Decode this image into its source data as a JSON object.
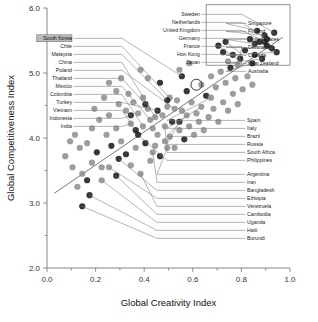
{
  "chart_data": {
    "type": "scatter",
    "title": "",
    "xlabel": "Global Creativity Index",
    "ylabel": "Global Competitiveness Index",
    "xlim": [
      0.0,
      1.0
    ],
    "ylim": [
      2.0,
      6.0
    ],
    "xticks": [
      "0.0",
      "0.2",
      "0.4",
      "0.6",
      "0.8",
      "1.0"
    ],
    "yticks": [
      "2.0",
      "3.0",
      "4.0",
      "5.0",
      "6.0"
    ],
    "xtick_values": [
      0.0,
      0.2,
      0.4,
      0.6,
      0.8,
      1.0
    ],
    "ytick_values": [
      2.0,
      3.0,
      4.0,
      5.0,
      6.0
    ],
    "minor_xticks": [
      0.1,
      0.3,
      0.5,
      0.7,
      0.9
    ],
    "minor_yticks": [
      2.5,
      3.5,
      4.5,
      5.5
    ],
    "grid": false,
    "legend": "none",
    "trendline": {
      "x0": 0.03,
      "y0": 3.15,
      "x1": 0.97,
      "y1": 5.55
    },
    "highlight_ring": {
      "x": 0.615,
      "y": 4.82,
      "r": 5.5
    },
    "inset_box": {
      "x0": 0.655,
      "y0": 5.12,
      "x1": 1.0,
      "y1": 6.05
    },
    "marker_colors": {
      "dark": "#1b1b1b",
      "gray": "#8f8f8f"
    },
    "labeled_points": [
      {
        "name": "South Korea",
        "x": 0.555,
        "y": 4.95,
        "color": "dark",
        "group": "left"
      },
      {
        "name": "Chile",
        "x": 0.505,
        "y": 4.62,
        "color": "gray",
        "group": "left"
      },
      {
        "name": "Malaysia",
        "x": 0.495,
        "y": 4.58,
        "color": "dark",
        "group": "left"
      },
      {
        "name": "China",
        "x": 0.445,
        "y": 4.32,
        "color": "gray",
        "group": "left"
      },
      {
        "name": "Poland",
        "x": 0.525,
        "y": 4.45,
        "color": "gray",
        "group": "left"
      },
      {
        "name": "Thailand",
        "x": 0.405,
        "y": 4.52,
        "color": "dark",
        "group": "left"
      },
      {
        "name": "Mexico",
        "x": 0.425,
        "y": 4.28,
        "color": "gray",
        "group": "left"
      },
      {
        "name": "Colombia",
        "x": 0.395,
        "y": 4.18,
        "color": "gray",
        "group": "left"
      },
      {
        "name": "Turkey",
        "x": 0.455,
        "y": 4.42,
        "color": "dark",
        "group": "left"
      },
      {
        "name": "Vietnam",
        "x": 0.365,
        "y": 4.12,
        "color": "dark",
        "group": "left"
      },
      {
        "name": "Indonesia",
        "x": 0.345,
        "y": 4.35,
        "color": "dark",
        "group": "left"
      },
      {
        "name": "India",
        "x": 0.345,
        "y": 4.22,
        "color": "gray",
        "group": "left"
      },
      {
        "name": "Sweden",
        "x": 0.935,
        "y": 5.62,
        "color": "dark",
        "group": "top"
      },
      {
        "name": "Netherlands",
        "x": 0.905,
        "y": 5.52,
        "color": "dark",
        "group": "top"
      },
      {
        "name": "United Kingdom",
        "x": 0.895,
        "y": 5.48,
        "color": "dark",
        "group": "top"
      },
      {
        "name": "Germany",
        "x": 0.835,
        "y": 5.52,
        "color": "dark",
        "group": "top"
      },
      {
        "name": "France",
        "x": 0.785,
        "y": 5.12,
        "color": "gray",
        "group": "top"
      },
      {
        "name": "Hon Kong",
        "x": 0.735,
        "y": 5.48,
        "color": "dark",
        "group": "top"
      },
      {
        "name": "Japan",
        "x": 0.705,
        "y": 5.42,
        "color": "dark",
        "group": "top"
      },
      {
        "name": "Singapore",
        "x": 0.865,
        "y": 5.65,
        "color": "dark",
        "group": "right-top"
      },
      {
        "name": "Finland",
        "x": 0.895,
        "y": 5.58,
        "color": "dark",
        "group": "right-top"
      },
      {
        "name": "United States",
        "x": 0.855,
        "y": 5.45,
        "color": "dark",
        "group": "right-top"
      },
      {
        "name": "Denmark",
        "x": 0.925,
        "y": 5.38,
        "color": "dark",
        "group": "right-top"
      },
      {
        "name": "Canada",
        "x": 0.945,
        "y": 5.32,
        "color": "dark",
        "group": "right-top"
      },
      {
        "name": "New Zealand",
        "x": 0.885,
        "y": 5.22,
        "color": "dark",
        "group": "right-top"
      },
      {
        "name": "Australia",
        "x": 0.845,
        "y": 5.15,
        "color": "dark",
        "group": "right-top"
      },
      {
        "name": "Spain",
        "x": 0.675,
        "y": 4.62,
        "color": "gray",
        "group": "right-mid"
      },
      {
        "name": "Italy",
        "x": 0.635,
        "y": 4.48,
        "color": "gray",
        "group": "right-mid"
      },
      {
        "name": "Brazil",
        "x": 0.575,
        "y": 4.35,
        "color": "gray",
        "group": "right-mid"
      },
      {
        "name": "Russia",
        "x": 0.545,
        "y": 4.25,
        "color": "dark",
        "group": "right-mid"
      },
      {
        "name": "South Africa",
        "x": 0.485,
        "y": 4.18,
        "color": "gray",
        "group": "right-mid"
      },
      {
        "name": "Philippines",
        "x": 0.375,
        "y": 4.05,
        "color": "dark",
        "group": "right-mid"
      },
      {
        "name": "Argentina",
        "x": 0.495,
        "y": 3.85,
        "color": "gray",
        "group": "right-low"
      },
      {
        "name": "Iran",
        "x": 0.435,
        "y": 3.78,
        "color": "gray",
        "group": "right-low"
      },
      {
        "name": "Bangladesh",
        "x": 0.295,
        "y": 3.68,
        "color": "dark",
        "group": "right-low"
      },
      {
        "name": "Ethiopia",
        "x": 0.255,
        "y": 3.55,
        "color": "gray",
        "group": "right-low"
      },
      {
        "name": "Venezuela",
        "x": 0.385,
        "y": 3.45,
        "color": "gray",
        "group": "right-low"
      },
      {
        "name": "Cambodia",
        "x": 0.285,
        "y": 3.42,
        "color": "dark",
        "group": "right-low"
      },
      {
        "name": "Uganda",
        "x": 0.225,
        "y": 3.35,
        "color": "gray",
        "group": "right-low"
      },
      {
        "name": "Haiti",
        "x": 0.175,
        "y": 3.12,
        "color": "dark",
        "group": "right-low"
      },
      {
        "name": "Burundi",
        "x": 0.145,
        "y": 2.95,
        "color": "dark",
        "group": "right-low"
      }
    ],
    "unlabeled_points": [
      {
        "x": 0.145,
        "y": 3.45,
        "color": "gray"
      },
      {
        "x": 0.185,
        "y": 3.62,
        "color": "gray"
      },
      {
        "x": 0.205,
        "y": 3.78,
        "color": "dark"
      },
      {
        "x": 0.225,
        "y": 3.55,
        "color": "gray"
      },
      {
        "x": 0.165,
        "y": 3.92,
        "color": "gray"
      },
      {
        "x": 0.245,
        "y": 4.05,
        "color": "gray"
      },
      {
        "x": 0.265,
        "y": 3.88,
        "color": "dark"
      },
      {
        "x": 0.285,
        "y": 4.15,
        "color": "gray"
      },
      {
        "x": 0.305,
        "y": 3.95,
        "color": "gray"
      },
      {
        "x": 0.325,
        "y": 4.42,
        "color": "gray"
      },
      {
        "x": 0.355,
        "y": 4.55,
        "color": "gray"
      },
      {
        "x": 0.375,
        "y": 4.38,
        "color": "gray"
      },
      {
        "x": 0.395,
        "y": 4.62,
        "color": "gray"
      },
      {
        "x": 0.415,
        "y": 4.45,
        "color": "gray"
      },
      {
        "x": 0.435,
        "y": 4.15,
        "color": "gray"
      },
      {
        "x": 0.455,
        "y": 4.05,
        "color": "gray"
      },
      {
        "x": 0.475,
        "y": 4.35,
        "color": "gray"
      },
      {
        "x": 0.495,
        "y": 4.48,
        "color": "gray"
      },
      {
        "x": 0.515,
        "y": 4.25,
        "color": "dark"
      },
      {
        "x": 0.535,
        "y": 4.58,
        "color": "gray"
      },
      {
        "x": 0.555,
        "y": 4.42,
        "color": "gray"
      },
      {
        "x": 0.575,
        "y": 4.72,
        "color": "dark"
      },
      {
        "x": 0.595,
        "y": 4.55,
        "color": "gray"
      },
      {
        "x": 0.615,
        "y": 4.38,
        "color": "gray"
      },
      {
        "x": 0.635,
        "y": 4.82,
        "color": "gray"
      },
      {
        "x": 0.655,
        "y": 4.65,
        "color": "dark"
      },
      {
        "x": 0.675,
        "y": 4.95,
        "color": "gray"
      },
      {
        "x": 0.695,
        "y": 4.78,
        "color": "gray"
      },
      {
        "x": 0.715,
        "y": 5.02,
        "color": "gray"
      },
      {
        "x": 0.735,
        "y": 4.85,
        "color": "gray"
      },
      {
        "x": 0.755,
        "y": 5.08,
        "color": "dark"
      },
      {
        "x": 0.775,
        "y": 4.92,
        "color": "gray"
      },
      {
        "x": 0.185,
        "y": 4.15,
        "color": "gray"
      },
      {
        "x": 0.215,
        "y": 4.28,
        "color": "gray"
      },
      {
        "x": 0.255,
        "y": 4.35,
        "color": "gray"
      },
      {
        "x": 0.295,
        "y": 4.52,
        "color": "gray"
      },
      {
        "x": 0.335,
        "y": 4.68,
        "color": "gray"
      },
      {
        "x": 0.125,
        "y": 3.25,
        "color": "gray"
      },
      {
        "x": 0.105,
        "y": 3.55,
        "color": "gray"
      },
      {
        "x": 0.165,
        "y": 3.35,
        "color": "dark"
      },
      {
        "x": 0.325,
        "y": 3.75,
        "color": "dark"
      },
      {
        "x": 0.345,
        "y": 3.58,
        "color": "gray"
      },
      {
        "x": 0.365,
        "y": 3.85,
        "color": "gray"
      },
      {
        "x": 0.405,
        "y": 3.92,
        "color": "dark"
      },
      {
        "x": 0.425,
        "y": 3.65,
        "color": "gray"
      },
      {
        "x": 0.445,
        "y": 3.88,
        "color": "gray"
      },
      {
        "x": 0.465,
        "y": 3.72,
        "color": "dark"
      },
      {
        "x": 0.485,
        "y": 3.95,
        "color": "gray"
      },
      {
        "x": 0.505,
        "y": 4.02,
        "color": "gray"
      },
      {
        "x": 0.525,
        "y": 3.85,
        "color": "gray"
      },
      {
        "x": 0.545,
        "y": 4.12,
        "color": "gray"
      },
      {
        "x": 0.565,
        "y": 3.98,
        "color": "dark"
      },
      {
        "x": 0.585,
        "y": 4.18,
        "color": "gray"
      },
      {
        "x": 0.605,
        "y": 4.05,
        "color": "gray"
      },
      {
        "x": 0.625,
        "y": 4.25,
        "color": "gray"
      },
      {
        "x": 0.645,
        "y": 4.12,
        "color": "gray"
      },
      {
        "x": 0.665,
        "y": 4.32,
        "color": "gray"
      },
      {
        "x": 0.685,
        "y": 4.45,
        "color": "gray"
      },
      {
        "x": 0.705,
        "y": 4.25,
        "color": "gray"
      },
      {
        "x": 0.725,
        "y": 4.55,
        "color": "gray"
      },
      {
        "x": 0.745,
        "y": 4.42,
        "color": "gray"
      },
      {
        "x": 0.765,
        "y": 4.68,
        "color": "gray"
      },
      {
        "x": 0.785,
        "y": 4.52,
        "color": "gray"
      },
      {
        "x": 0.805,
        "y": 4.75,
        "color": "gray"
      },
      {
        "x": 0.825,
        "y": 4.95,
        "color": "gray"
      },
      {
        "x": 0.845,
        "y": 4.82,
        "color": "gray"
      },
      {
        "x": 0.795,
        "y": 5.22,
        "color": "dark"
      },
      {
        "x": 0.815,
        "y": 5.35,
        "color": "dark"
      },
      {
        "x": 0.765,
        "y": 5.28,
        "color": "dark"
      },
      {
        "x": 0.745,
        "y": 5.18,
        "color": "gray"
      },
      {
        "x": 0.725,
        "y": 5.32,
        "color": "dark"
      },
      {
        "x": 0.875,
        "y": 5.48,
        "color": "dark"
      },
      {
        "x": 0.855,
        "y": 5.28,
        "color": "dark"
      },
      {
        "x": 0.905,
        "y": 5.42,
        "color": "dark"
      },
      {
        "x": 0.255,
        "y": 4.85,
        "color": "gray"
      },
      {
        "x": 0.285,
        "y": 4.72,
        "color": "gray"
      },
      {
        "x": 0.195,
        "y": 4.45,
        "color": "gray"
      },
      {
        "x": 0.235,
        "y": 4.62,
        "color": "gray"
      },
      {
        "x": 0.115,
        "y": 4.05,
        "color": "gray"
      },
      {
        "x": 0.135,
        "y": 3.85,
        "color": "gray"
      },
      {
        "x": 0.075,
        "y": 3.72,
        "color": "gray"
      },
      {
        "x": 0.095,
        "y": 3.95,
        "color": "gray"
      },
      {
        "x": 0.305,
        "y": 4.92,
        "color": "gray"
      },
      {
        "x": 0.415,
        "y": 4.92,
        "color": "gray"
      },
      {
        "x": 0.385,
        "y": 5.05,
        "color": "gray"
      },
      {
        "x": 0.465,
        "y": 4.85,
        "color": "dark"
      },
      {
        "x": 0.585,
        "y": 5.15,
        "color": "gray"
      },
      {
        "x": 0.545,
        "y": 5.05,
        "color": "gray"
      }
    ]
  },
  "axes": {
    "x_title": "Global Creativity Index",
    "y_title": "Global Competitiveness Index"
  }
}
